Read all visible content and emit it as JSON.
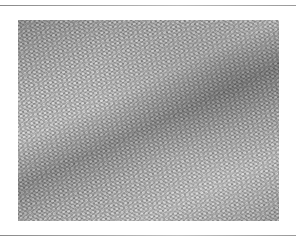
{
  "figure": {
    "colors": {
      "background": "#ffffff",
      "rule": "#9a9a9a",
      "lattice_base": "#6e6e6e",
      "lattice_dot": "#ebebeb"
    }
  }
}
